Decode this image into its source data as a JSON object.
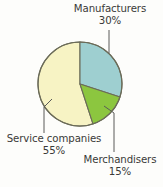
{
  "chart_data": {
    "type": "pie",
    "title": "",
    "xlabel": "",
    "ylabel": "",
    "legend_position": "callout-labels",
    "grid": false,
    "start_angle_deg": 0,
    "direction": "clockwise",
    "total": 100,
    "units": "%",
    "categories": [
      "Manufacturers",
      "Service companies",
      "Merchandisers"
    ],
    "values": [
      30,
      55,
      15
    ],
    "slices": [
      {
        "label": "Manufacturers",
        "value": 30,
        "value_text": "30%",
        "color": "#9ecfd0",
        "start_deg": 0,
        "end_deg": 108
      },
      {
        "label": "Merchandisers",
        "value": 15,
        "value_text": "15%",
        "color": "#8cc63f",
        "start_deg": 108,
        "end_deg": 162
      },
      {
        "label": "Service companies",
        "value": 55,
        "value_text": "55%",
        "color": "#f7f3c4",
        "start_deg": 162,
        "end_deg": 360
      }
    ]
  },
  "labels": {
    "manufacturers": {
      "name": "Manufacturers",
      "value": "30%"
    },
    "service_companies": {
      "name": "Service companies",
      "value": "55%"
    },
    "merchandisers": {
      "name": "Merchandisers",
      "value": "15%"
    }
  },
  "colors": {
    "background": "#fdfdfb",
    "manufacturers": "#9ecfd0",
    "service_companies": "#f7f3c4",
    "merchandisers": "#8cc63f",
    "outline": "#6b6b58",
    "leader_line": "#5a5a58",
    "text": "#3a3a38"
  }
}
